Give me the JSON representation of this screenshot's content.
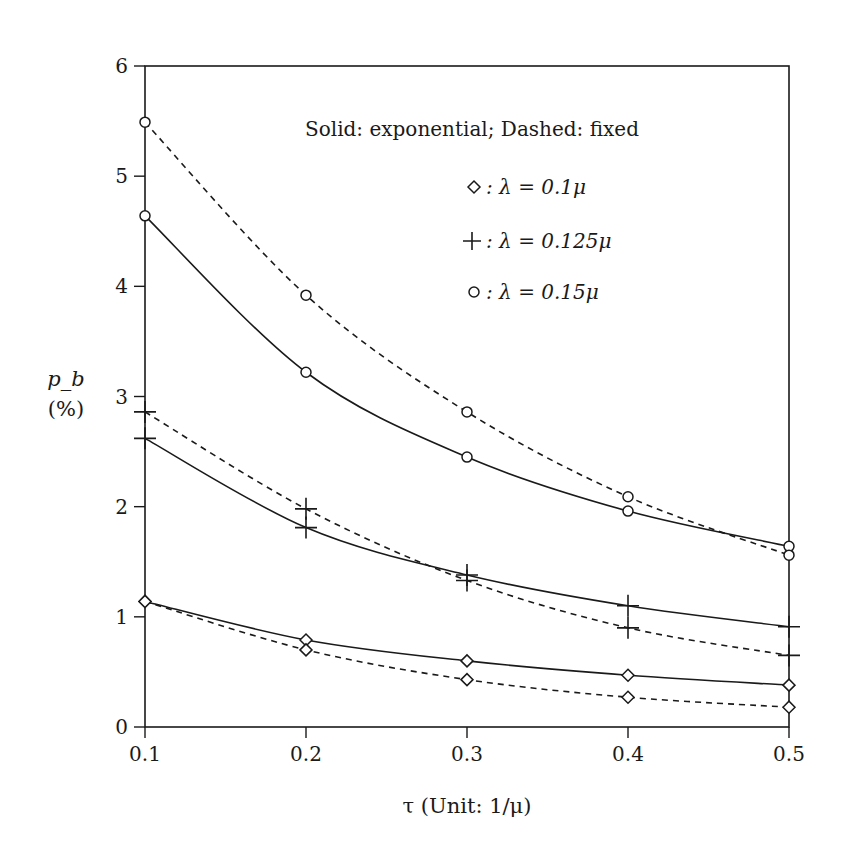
{
  "chart_data": {
    "type": "line",
    "title": "",
    "legend_heading": "Solid: exponential; Dashed: fixed",
    "legend": [
      {
        "marker": "diamond",
        "label": "◇ : λ = 0.1μ",
        "symbol": "◇",
        "text": ": λ = 0.1μ"
      },
      {
        "marker": "plus",
        "label": "+ : λ = 0.125μ",
        "symbol": "+",
        "text": ": λ = 0.125μ"
      },
      {
        "marker": "circle",
        "label": "○ : λ = 0.15μ",
        "symbol": "○",
        "text": ": λ = 0.15μ"
      }
    ],
    "legend_position": "upper right (inside)",
    "xlabel": "τ (Unit: 1/μ)",
    "ylabel_line1": "p_b",
    "ylabel_line2": "(%)",
    "x": [
      0.1,
      0.2,
      0.3,
      0.4,
      0.5
    ],
    "xlim": [
      0.1,
      0.5
    ],
    "ylim": [
      0,
      6
    ],
    "xticks": [
      "0.1",
      "0.2",
      "0.3",
      "0.4",
      "0.5"
    ],
    "yticks": [
      "0",
      "1",
      "2",
      "3",
      "4",
      "5",
      "6"
    ],
    "grid": false,
    "series": [
      {
        "name": "λ = 0.1μ, exponential",
        "marker": "diamond",
        "style": "solid",
        "values": [
          1.14,
          0.79,
          0.6,
          0.47,
          0.38
        ]
      },
      {
        "name": "λ = 0.1μ, fixed",
        "marker": "diamond",
        "style": "dashed",
        "values": [
          1.14,
          0.7,
          0.43,
          0.27,
          0.18
        ]
      },
      {
        "name": "λ = 0.125μ, exponential",
        "marker": "plus",
        "style": "solid",
        "values": [
          2.62,
          1.81,
          1.38,
          1.1,
          0.91
        ]
      },
      {
        "name": "λ = 0.125μ, fixed",
        "marker": "plus",
        "style": "dashed",
        "values": [
          2.86,
          1.98,
          1.33,
          0.9,
          0.65
        ]
      },
      {
        "name": "λ = 0.15μ, exponential",
        "marker": "circle",
        "style": "solid",
        "values": [
          4.64,
          3.22,
          2.45,
          1.96,
          1.64
        ]
      },
      {
        "name": "λ = 0.15μ, fixed",
        "marker": "circle",
        "style": "dashed",
        "values": [
          5.49,
          3.92,
          2.86,
          2.09,
          1.56
        ]
      }
    ]
  }
}
